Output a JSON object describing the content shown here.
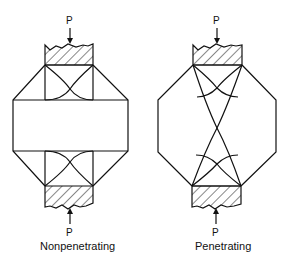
{
  "figure": {
    "panels": [
      {
        "id": "nonpenetrating",
        "caption": "Nonpenetrating",
        "top_load_label": "P",
        "bottom_load_label": "P"
      },
      {
        "id": "penetrating",
        "caption": "Penetrating",
        "top_load_label": "P",
        "bottom_load_label": "P"
      }
    ],
    "colors": {
      "line": "#111111",
      "background": "#ffffff"
    }
  }
}
